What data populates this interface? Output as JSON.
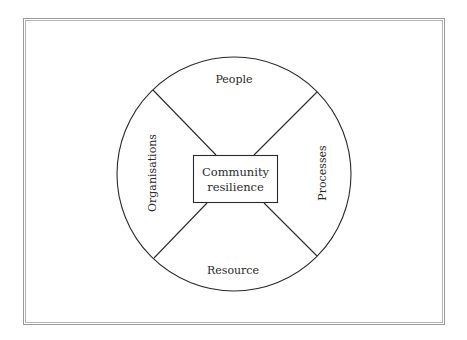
{
  "diagram": {
    "center": {
      "line1": "Community",
      "line2": "resilience"
    },
    "segments": {
      "top": "People",
      "right": "Processes",
      "bottom": "Resource",
      "left": "Organisations"
    }
  },
  "colors": {
    "stroke": "#2a2a2a",
    "frame": "#9a9a9a",
    "background": "#ffffff"
  }
}
